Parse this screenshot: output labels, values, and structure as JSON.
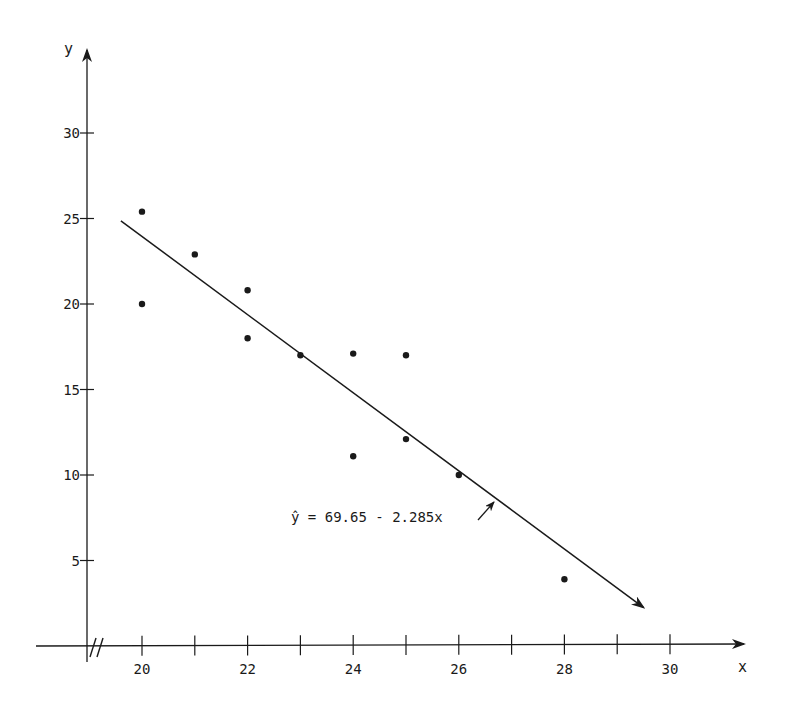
{
  "chart_data": {
    "type": "scatter",
    "title": "",
    "xlabel": "x",
    "ylabel": "y",
    "xlim": [
      19,
      31
    ],
    "ylim": [
      0,
      35
    ],
    "x_axis_break": true,
    "grid": false,
    "legend": null,
    "x_ticks": [
      20,
      21,
      22,
      23,
      24,
      25,
      26,
      27,
      28,
      29,
      30
    ],
    "x_tick_labels": [
      "20",
      "22",
      "24",
      "26",
      "28",
      "30"
    ],
    "y_ticks": [
      5,
      10,
      15,
      20,
      25,
      30
    ],
    "y_tick_labels": [
      "5",
      "10",
      "15",
      "20",
      "25",
      "30"
    ],
    "series": [
      {
        "name": "observations",
        "type": "scatter",
        "points": [
          {
            "x": 20,
            "y": 25.4
          },
          {
            "x": 20,
            "y": 20.0
          },
          {
            "x": 21,
            "y": 22.9
          },
          {
            "x": 22,
            "y": 20.8
          },
          {
            "x": 22,
            "y": 18.0
          },
          {
            "x": 23,
            "y": 17.0
          },
          {
            "x": 24,
            "y": 17.1
          },
          {
            "x": 24,
            "y": 11.1
          },
          {
            "x": 25,
            "y": 17.0
          },
          {
            "x": 25,
            "y": 12.1
          },
          {
            "x": 26,
            "y": 10.0
          },
          {
            "x": 28,
            "y": 3.9
          }
        ]
      },
      {
        "name": "regression line",
        "type": "line",
        "intercept": 69.65,
        "slope": -2.285,
        "x_start": 19.6,
        "x_end": 29.5
      }
    ],
    "annotations": [
      {
        "text": "ŷ = 69.65 - 2.285x",
        "points_to": {
          "x": 26.8,
          "y": 8.6
        }
      }
    ]
  },
  "labels": {
    "x_axis": "x",
    "y_axis": "y",
    "equation": "ŷ = 69.65 - 2.285x",
    "axis_break": "//"
  }
}
